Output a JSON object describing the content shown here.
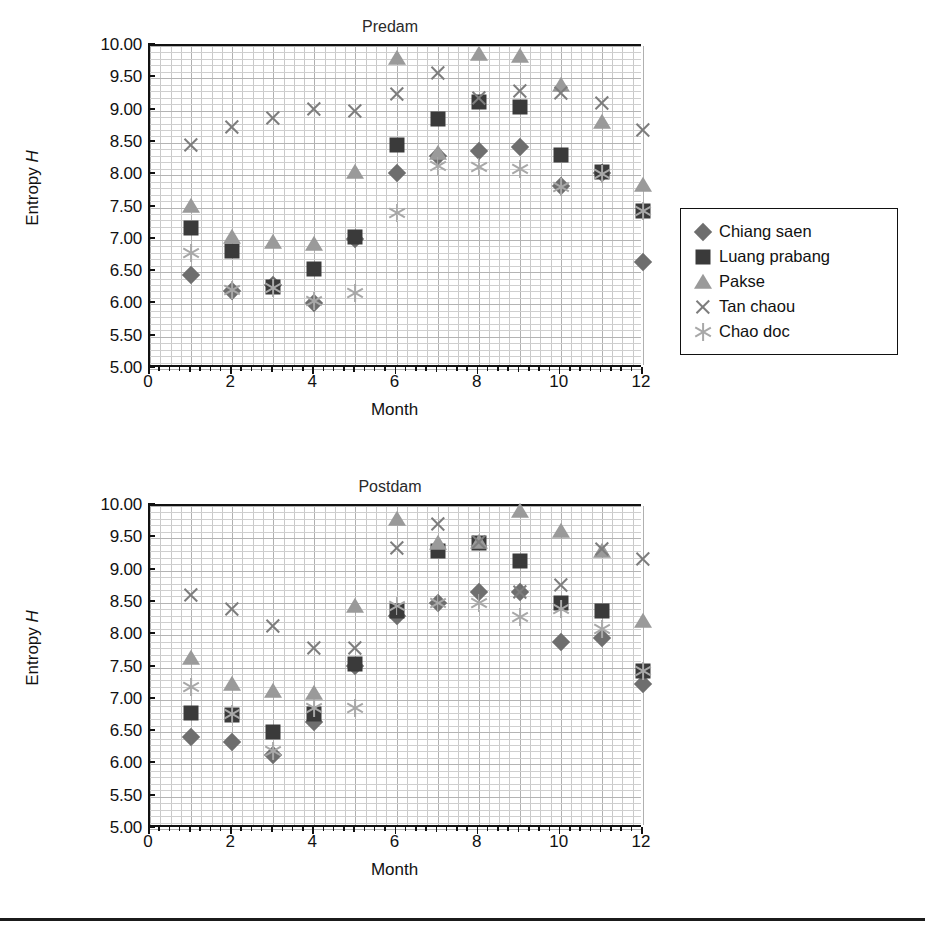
{
  "figure": {
    "rule_present": true
  },
  "legend": {
    "entries": [
      {
        "label": "Chiang saen",
        "marker": "diamond",
        "color": "#6e6e6e"
      },
      {
        "label": "Luang prabang",
        "marker": "square",
        "color": "#3a3a3a"
      },
      {
        "label": "Pakse",
        "marker": "triangle",
        "color": "#9a9a9a"
      },
      {
        "label": "Tan chaou",
        "marker": "x",
        "color": "#7d7d7d"
      },
      {
        "label": "Chao doc",
        "marker": "star",
        "color": "#a8a8a8"
      }
    ]
  },
  "chart_data": [
    {
      "type": "scatter",
      "title": "Predam",
      "xlabel": "Month",
      "ylabel": "Entropy H",
      "xlim": [
        0,
        12
      ],
      "ylim": [
        5.0,
        10.0
      ],
      "xticks": [
        0,
        2,
        4,
        6,
        8,
        10,
        12
      ],
      "xtick_labels": [
        "0",
        "2",
        "4",
        "6",
        "8",
        "10",
        "12"
      ],
      "yticks": [
        5.0,
        5.5,
        6.0,
        6.5,
        7.0,
        7.5,
        8.0,
        8.5,
        9.0,
        9.5,
        10.0
      ],
      "ytick_labels": [
        "5.00",
        "5.50",
        "6.00",
        "6.50",
        "7.00",
        "7.50",
        "8.00",
        "8.50",
        "9.00",
        "9.50",
        "10.00"
      ],
      "grid": true,
      "legend_position": "right",
      "x": [
        1,
        2,
        3,
        4,
        5,
        6,
        7,
        8,
        9,
        10,
        11,
        12
      ],
      "series": [
        {
          "name": "Chiang saen",
          "marker": "diamond",
          "color": "#6e6e6e",
          "values": [
            6.45,
            6.2,
            6.3,
            6.02,
            7.02,
            8.03,
            8.3,
            8.38,
            8.44,
            7.83,
            8.03,
            6.65
          ]
        },
        {
          "name": "Luang prabang",
          "marker": "square",
          "color": "#3a3a3a",
          "values": [
            7.18,
            6.82,
            6.27,
            6.55,
            7.05,
            8.47,
            8.87,
            9.13,
            9.05,
            8.32,
            8.05,
            7.45
          ]
        },
        {
          "name": "Pakse",
          "marker": "triangle",
          "color": "#9a9a9a",
          "values": [
            7.52,
            7.05,
            6.97,
            6.93,
            8.05,
            9.82,
            8.35,
            9.87,
            9.85,
            9.4,
            8.82,
            7.85
          ]
        },
        {
          "name": "Tan chaou",
          "marker": "x",
          "color": "#7d7d7d",
          "values": [
            8.47,
            8.75,
            8.88,
            9.02,
            9.0,
            9.25,
            9.58,
            9.2,
            9.3,
            9.27,
            9.12,
            8.7
          ]
        },
        {
          "name": "Chao doc",
          "marker": "star",
          "color": "#a8a8a8",
          "values": [
            6.8,
            6.22,
            6.25,
            6.05,
            6.17,
            7.42,
            8.15,
            8.12,
            8.1,
            7.82,
            8.02,
            7.45
          ]
        }
      ]
    },
    {
      "type": "scatter",
      "title": "Postdam",
      "xlabel": "Month",
      "ylabel": "Entropy H",
      "xlim": [
        0,
        12
      ],
      "ylim": [
        5.0,
        10.0
      ],
      "xticks": [
        0,
        2,
        4,
        6,
        8,
        10,
        12
      ],
      "xtick_labels": [
        "0",
        "2",
        "4",
        "6",
        "8",
        "10",
        "12"
      ],
      "yticks": [
        5.0,
        5.5,
        6.0,
        6.5,
        7.0,
        7.5,
        8.0,
        8.5,
        9.0,
        9.5,
        10.0
      ],
      "ytick_labels": [
        "5.00",
        "5.50",
        "6.00",
        "6.50",
        "7.00",
        "7.50",
        "8.00",
        "8.50",
        "9.00",
        "9.50",
        "10.00"
      ],
      "grid": true,
      "legend_position": "right",
      "x": [
        1,
        2,
        3,
        4,
        5,
        6,
        7,
        8,
        9,
        10,
        11,
        12
      ],
      "series": [
        {
          "name": "Chiang saen",
          "marker": "diamond",
          "color": "#6e6e6e",
          "values": [
            6.42,
            6.35,
            6.15,
            6.65,
            7.52,
            8.3,
            8.5,
            8.67,
            8.67,
            7.9,
            7.95,
            7.25
          ]
        },
        {
          "name": "Luang prabang",
          "marker": "square",
          "color": "#3a3a3a",
          "values": [
            6.8,
            6.77,
            6.5,
            6.78,
            7.55,
            8.38,
            9.3,
            9.43,
            9.15,
            8.5,
            8.38,
            7.45
          ]
        },
        {
          "name": "Pakse",
          "marker": "triangle",
          "color": "#9a9a9a",
          "values": [
            7.65,
            7.25,
            7.13,
            7.1,
            8.45,
            9.8,
            9.43,
            9.45,
            9.92,
            9.62,
            9.3,
            8.22
          ]
        },
        {
          "name": "Tan chaou",
          "marker": "x",
          "color": "#7d7d7d",
          "values": [
            8.63,
            8.4,
            8.15,
            7.8,
            7.8,
            9.35,
            9.72,
            9.45,
            8.67,
            8.78,
            9.33,
            9.18
          ]
        },
        {
          "name": "Chao doc",
          "marker": "star",
          "color": "#a8a8a8",
          "values": [
            7.2,
            6.78,
            6.2,
            6.88,
            6.88,
            8.45,
            8.5,
            8.5,
            8.28,
            8.4,
            8.1,
            7.45
          ]
        }
      ]
    }
  ]
}
